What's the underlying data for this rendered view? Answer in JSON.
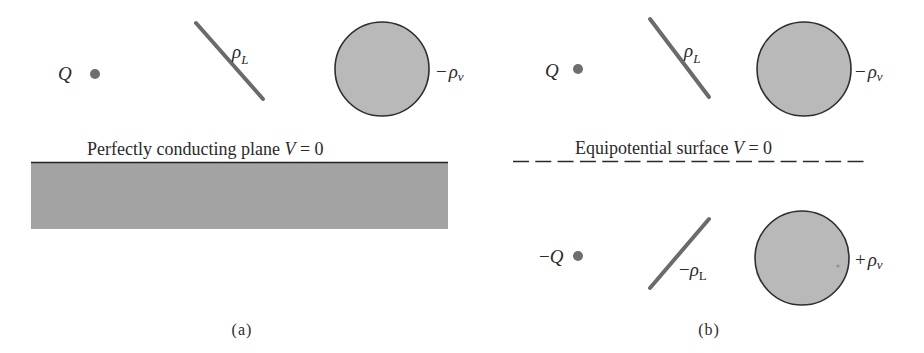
{
  "figure": {
    "panels": [
      {
        "id": "a",
        "label": "(a)",
        "point_charge": {
          "label": "Q"
        },
        "line_charge": {
          "symbol": "ρ",
          "subscript": "L",
          "sign": ""
        },
        "volume_charge": {
          "prefix": "−",
          "symbol": "ρ",
          "subscript": "v"
        },
        "boundary": {
          "type": "perfectly-conducting-plane",
          "caption_text": "Perfectly conducting plane ",
          "caption_var": "V",
          "caption_eq": " = 0"
        }
      },
      {
        "id": "b",
        "label": "(b)",
        "point_charge": {
          "label": "Q"
        },
        "line_charge": {
          "symbol": "ρ",
          "subscript": "L",
          "sign": ""
        },
        "volume_charge": {
          "prefix": "−",
          "symbol": "ρ",
          "subscript": "v"
        },
        "boundary": {
          "type": "equipotential-surface",
          "caption_text": "Equipotential surface ",
          "caption_var": "V",
          "caption_eq": " = 0"
        },
        "images": {
          "point_charge": {
            "prefix": "−",
            "label": "Q"
          },
          "line_charge": {
            "prefix": "−",
            "symbol": "ρ",
            "subscript": "L"
          },
          "volume_charge": {
            "prefix": "+",
            "symbol": "ρ",
            "subscript": "v"
          }
        }
      }
    ],
    "colors": {
      "charge_fill": "#6e6e6e",
      "line_stroke": "#6b6b6b",
      "sphere_fill": "#b9b9b9",
      "sphere_stroke": "#2e2e2e",
      "plane_fill": "#a3a3a3",
      "plane_edge": "#222222",
      "text": "#2a2a2a"
    }
  }
}
